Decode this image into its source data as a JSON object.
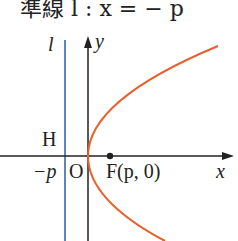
{
  "title": "準線 l : x = − p",
  "labels": {
    "directrix": "l",
    "y_axis": "y",
    "x_axis": "x",
    "H": "H",
    "neg_p": "−p",
    "origin": "O",
    "focus": "F(p, 0)"
  },
  "colors": {
    "parabola": "#e8602c",
    "directrix": "#5b86c4",
    "axes": "#222222"
  }
}
